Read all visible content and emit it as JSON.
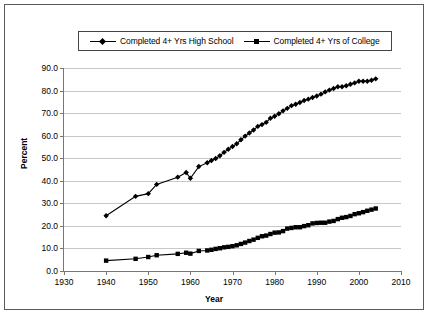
{
  "chart_data": {
    "type": "line",
    "title": "",
    "xlabel": "Year",
    "ylabel": "Percent",
    "xlim": [
      1930,
      2010
    ],
    "ylim": [
      0,
      90
    ],
    "grid": true,
    "legend_position": "top",
    "xticks": [
      "1930",
      "1940",
      "1950",
      "1960",
      "1970",
      "1980",
      "1990",
      "2000",
      "2010"
    ],
    "yticks": [
      "0.0",
      "10.0",
      "20.0",
      "30.0",
      "40.0",
      "50.0",
      "60.0",
      "70.0",
      "80.0",
      "90.0"
    ],
    "series": [
      {
        "name": "Completed 4+ Yrs High School",
        "marker": "diamond",
        "color": "#000000",
        "x": [
          1940,
          1947,
          1950,
          1952,
          1957,
          1959,
          1960,
          1962,
          1964,
          1965,
          1966,
          1967,
          1968,
          1969,
          1970,
          1971,
          1972,
          1973,
          1974,
          1975,
          1976,
          1977,
          1978,
          1979,
          1980,
          1981,
          1982,
          1983,
          1984,
          1985,
          1986,
          1987,
          1988,
          1989,
          1990,
          1991,
          1992,
          1993,
          1994,
          1995,
          1996,
          1997,
          1998,
          1999,
          2000,
          2001,
          2002,
          2003,
          2004
        ],
        "y": [
          24.5,
          33.1,
          34.3,
          38.4,
          41.6,
          43.7,
          41.1,
          46.3,
          48.0,
          49.0,
          49.9,
          51.1,
          52.6,
          54.0,
          55.2,
          56.4,
          58.2,
          59.8,
          61.2,
          62.5,
          64.1,
          64.9,
          65.9,
          67.7,
          68.6,
          69.7,
          71.0,
          72.1,
          73.3,
          73.9,
          74.7,
          75.6,
          76.2,
          76.9,
          77.6,
          78.4,
          79.4,
          80.2,
          80.9,
          81.7,
          81.7,
          82.1,
          82.8,
          83.4,
          84.1,
          84.1,
          84.1,
          84.6,
          85.2
        ]
      },
      {
        "name": "Completed 4+ Yrs of College",
        "marker": "square",
        "color": "#000000",
        "x": [
          1940,
          1947,
          1950,
          1952,
          1957,
          1959,
          1960,
          1962,
          1964,
          1965,
          1966,
          1967,
          1968,
          1969,
          1970,
          1971,
          1972,
          1973,
          1974,
          1975,
          1976,
          1977,
          1978,
          1979,
          1980,
          1981,
          1982,
          1983,
          1984,
          1985,
          1986,
          1987,
          1988,
          1989,
          1990,
          1991,
          1992,
          1993,
          1994,
          1995,
          1996,
          1997,
          1998,
          1999,
          2000,
          2001,
          2002,
          2003,
          2004
        ],
        "y": [
          4.6,
          5.4,
          6.2,
          7.0,
          7.6,
          8.1,
          7.7,
          8.9,
          9.1,
          9.4,
          9.8,
          10.1,
          10.5,
          10.7,
          11.0,
          11.4,
          12.0,
          12.6,
          13.3,
          13.9,
          14.7,
          15.4,
          15.7,
          16.4,
          17.0,
          17.1,
          17.7,
          18.8,
          19.1,
          19.4,
          19.4,
          19.9,
          20.3,
          21.1,
          21.3,
          21.4,
          21.4,
          21.9,
          22.2,
          23.0,
          23.6,
          23.9,
          24.4,
          25.2,
          25.6,
          26.1,
          26.7,
          27.2,
          27.7
        ]
      }
    ]
  }
}
